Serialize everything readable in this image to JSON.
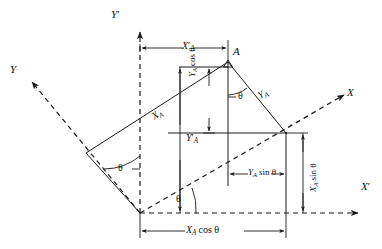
{
  "figure": {
    "type": "geometry-diagram",
    "background_color": "#ffffff",
    "line_color": "#1a1a1a",
    "angle_symbol": "θ"
  },
  "axes": [
    {
      "id": "y-prime-axis",
      "label": "Y",
      "prime": "′",
      "style": "dashed",
      "direction": "up",
      "note": "vertical dashed axis through origin"
    },
    {
      "id": "x-prime-axis",
      "label": "X",
      "prime": "′",
      "style": "dashed",
      "direction": "right",
      "note": "horizontal dashed axis through origin"
    },
    {
      "id": "x-axis",
      "label": "X",
      "prime": "",
      "style": "dashed",
      "direction": "up-right",
      "note": "rotated X axis, inclined by theta above X-prime"
    },
    {
      "id": "y-axis",
      "label": "Y",
      "prime": "",
      "style": "dashed",
      "direction": "up-left",
      "note": "rotated Y axis, inclined by theta from Y-prime"
    }
  ],
  "points": [
    {
      "id": "point-a",
      "label": "A",
      "note": "point being transformed"
    }
  ],
  "angles": [
    {
      "id": "theta-origin-x",
      "label": "θ",
      "note": "between X axis and X′ axis at origin"
    },
    {
      "id": "theta-origin-y",
      "label": "θ",
      "note": "between Y axis and Y′ axis"
    },
    {
      "id": "theta-at-point-a",
      "label": "θ",
      "note": "at point A between vertical drop and Y_A segment"
    }
  ],
  "dimensions": [
    {
      "id": "x-prime-a",
      "base": "X",
      "prime": "′",
      "sub": "A",
      "trig": "",
      "orientation": "horizontal",
      "position": "top",
      "text": "X′A"
    },
    {
      "id": "y-prime-a",
      "base": "Y",
      "prime": "′",
      "sub": "A",
      "trig": "",
      "orientation": "vertical",
      "position": "center-left",
      "text": "Y′A"
    },
    {
      "id": "y-a-cos",
      "base": "Y",
      "prime": "",
      "sub": "A",
      "trig": "cos θ",
      "orientation": "vertical",
      "position": "upper-middle",
      "text": "YA cos θ"
    },
    {
      "id": "y-a-sin",
      "base": "Y",
      "prime": "",
      "sub": "A",
      "trig": "sin θ",
      "orientation": "horizontal",
      "position": "lower-middle",
      "text": "YA sin θ"
    },
    {
      "id": "x-a-sin",
      "base": "X",
      "prime": "",
      "sub": "A",
      "trig": "sin θ",
      "orientation": "vertical",
      "position": "right",
      "text": "XA sin θ"
    },
    {
      "id": "x-a-cos",
      "base": "X",
      "prime": "",
      "sub": "A",
      "trig": "cos θ",
      "orientation": "horizontal",
      "position": "bottom",
      "text": "XA cos θ"
    }
  ],
  "segments": [
    {
      "id": "x-a-segment",
      "base": "X",
      "prime": "",
      "sub": "A",
      "text": "XA",
      "orientation": "along-x-axis-direction",
      "note": "distance along rotated X axis from origin to A"
    },
    {
      "id": "y-a-segment",
      "base": "Y",
      "prime": "",
      "sub": "A",
      "text": "YA",
      "orientation": "along-y-axis-direction",
      "note": "distance along rotated Y axis direction from A"
    }
  ],
  "labels": {
    "Y_prime_axis": "Y",
    "X_prime_axis": "X",
    "X_axis": "X",
    "Y_axis": "Y",
    "point_A": "A",
    "prime_mark": "′",
    "sub_A": "A",
    "theta": "θ",
    "cos_theta": "cos θ",
    "sin_theta": "sin θ"
  }
}
